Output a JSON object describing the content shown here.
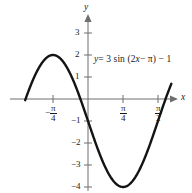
{
  "figure": {
    "background_color": "#ffffff",
    "curve_color": "#141414",
    "axis_color": "#6e6e6e",
    "text_color": "#1a1a1a"
  },
  "equation_label": {
    "full_text": "y = 3 sin (2x − π) − 1",
    "lhs": "y",
    "eq": "= 3 sin (2",
    "var": "x",
    "rhs": "− π) − 1"
  },
  "axes": {
    "x_name": "x",
    "y_name": "y",
    "x_ticks": [
      {
        "label": "−π/4",
        "sign": "−",
        "num": "π",
        "den": "4",
        "value": -0.7854
      },
      {
        "label": "π/4",
        "sign": "",
        "num": "π",
        "den": "4",
        "value": 0.7854
      },
      {
        "label": "π/2",
        "sign": "",
        "num": "π",
        "den": "2",
        "value": 1.5708
      }
    ],
    "y_ticks": [
      {
        "label": "3",
        "value": 3
      },
      {
        "label": "2",
        "value": 2
      },
      {
        "label": "1",
        "value": 1
      },
      {
        "label": "−1",
        "value": -1
      },
      {
        "label": "−2",
        "value": -2
      },
      {
        "label": "−3",
        "value": -3
      },
      {
        "label": "−4",
        "value": -4
      }
    ]
  },
  "chart_data": {
    "type": "line",
    "title": "",
    "subtitle": "",
    "xlabel": "x",
    "ylabel": "y",
    "grid": false,
    "legend": false,
    "annotations": [
      "y = 3 sin (2x − π) − 1"
    ],
    "function": "y = 3*sin(2*x - pi) - 1",
    "amplitude": 3,
    "period": 3.1416,
    "phase_shift": 1.5708,
    "vertical_shift": -1,
    "xlim": [
      -1.41,
      1.87
    ],
    "ylim": [
      -4.5,
      3.6
    ],
    "xticks": [
      -0.7854,
      0.7854,
      1.5708
    ],
    "xticklabels": [
      "−π/4",
      "π/4",
      "π/2"
    ],
    "yticks": [
      3,
      2,
      1,
      -1,
      -2,
      -3,
      -4
    ],
    "yticklabels": [
      "3",
      "2",
      "1",
      "−1",
      "−2",
      "−3",
      "−4"
    ],
    "maximum": {
      "x": -0.7854,
      "y": 2
    },
    "minimum": {
      "x": 0.7854,
      "y": -4
    },
    "series": [
      {
        "name": "y = 3 sin (2x − π) − 1",
        "x": [
          -1.41,
          -1.3,
          -1.2,
          -1.1,
          -1.0,
          -0.9,
          -0.7854,
          -0.7,
          -0.6,
          -0.5,
          -0.4,
          -0.3,
          -0.2,
          -0.1,
          0.0,
          0.1,
          0.2,
          0.3,
          0.4,
          0.5,
          0.6,
          0.7,
          0.7854,
          0.9,
          1.0,
          1.1,
          1.2,
          1.3,
          1.4,
          1.5,
          1.5708,
          1.7,
          1.87
        ],
        "y": [
          -1.88,
          -0.68,
          0.17,
          0.92,
          1.53,
          1.92,
          2.0,
          1.98,
          1.81,
          1.52,
          1.12,
          0.65,
          0.13,
          -0.41,
          -1.0,
          -1.59,
          -2.13,
          -2.65,
          -3.12,
          -3.52,
          -3.81,
          -3.98,
          -4.0,
          -3.92,
          -3.72,
          -3.38,
          -2.93,
          -2.39,
          -1.77,
          -1.12,
          -1.0,
          0.51,
          1.8
        ]
      }
    ]
  }
}
